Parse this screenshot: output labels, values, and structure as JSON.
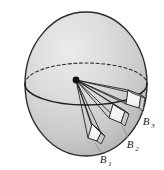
{
  "figure": {
    "background_color": "#ffffff",
    "sphere": {
      "name": "sphere",
      "center_x": 86,
      "center_y": 84,
      "radius_x": 61,
      "radius_y": 72,
      "fill_light": "#e2e2e2",
      "fill_mid": "#c9c9c9",
      "fill_dark": "#b4b4b4",
      "outline_color": "#2b2b2b"
    },
    "equator": {
      "name": "equator-ellipse",
      "front_style": "solid",
      "back_style": "dashed",
      "dash_pattern": "3,2.5",
      "color": "#2b2b2b"
    },
    "apex": {
      "name": "apex-point",
      "x": 76,
      "y": 80,
      "radius": 3.2,
      "color": "#111111"
    },
    "rays": {
      "name": "ray-fan",
      "count": 12,
      "color": "#1a1a1a",
      "width": 0.85
    },
    "patches": [
      {
        "id": "B1",
        "label": "B",
        "subscript": "1",
        "name": "patch-b1",
        "face_fill": "#f2f2f2",
        "side_fill": "#cfcfcf",
        "outline": "#2b2b2b",
        "label_x": 103,
        "label_y": 160,
        "leader": "from label up-left to patch corner"
      },
      {
        "id": "B2",
        "label": "B",
        "subscript": "2",
        "name": "patch-b2",
        "face_fill": "#f2f2f2",
        "side_fill": "#cfcfcf",
        "outline": "#2b2b2b",
        "label_x": 130,
        "label_y": 145,
        "leader": "from label up-left to patch corner"
      },
      {
        "id": "B3",
        "label": "B",
        "subscript": "3",
        "name": "patch-b3",
        "face_fill": "#f2f2f2",
        "side_fill": "#cfcfcf",
        "outline": "#2b2b2b",
        "label_x": 145,
        "label_y": 122,
        "leader": "from label up-left to patch corner"
      }
    ],
    "leader_color": "#8a8a8a"
  }
}
